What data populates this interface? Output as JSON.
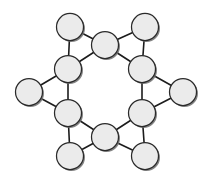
{
  "figure": {
    "background_color": "#ffffff",
    "width": 209,
    "height": 183
  },
  "chart_data": {
    "type": "scatter",
    "title": "",
    "subtitle": "",
    "xlabel": "",
    "ylabel": "",
    "xlim": [
      0,
      209
    ],
    "ylim": [
      0,
      183
    ],
    "grid": false,
    "legend": null,
    "annotations": [],
    "style": {
      "node_fill": "#ebebeb",
      "node_stroke": "#2a2a2a",
      "node_stroke_width": 1.25,
      "node_radius": 13.5,
      "node_shadow_color": "#6e6e6e",
      "node_shadow_offset": 1.5,
      "edge_color": "#1c1c1c",
      "edge_width": 1.6
    },
    "node_count": 14,
    "edge_count": 18,
    "nodes": [
      {
        "id": "inner-top",
        "label": "",
        "x": 105,
        "y": 45,
        "r": 13.5,
        "ring": "inner"
      },
      {
        "id": "inner-upper-right",
        "label": "",
        "x": 142,
        "y": 69,
        "r": 13.5,
        "ring": "inner"
      },
      {
        "id": "inner-lower-right",
        "label": "",
        "x": 142,
        "y": 113,
        "r": 13.5,
        "ring": "inner"
      },
      {
        "id": "inner-bottom",
        "label": "",
        "x": 105,
        "y": 137,
        "r": 13.5,
        "ring": "inner"
      },
      {
        "id": "inner-lower-left",
        "label": "",
        "x": 68,
        "y": 113,
        "r": 13.5,
        "ring": "inner"
      },
      {
        "id": "inner-upper-left",
        "label": "",
        "x": 68,
        "y": 69,
        "r": 13.5,
        "ring": "inner"
      },
      {
        "id": "outer-top-left",
        "label": "",
        "x": 70,
        "y": 27,
        "r": 13.5,
        "ring": "outer"
      },
      {
        "id": "outer-top-right",
        "label": "",
        "x": 145,
        "y": 27,
        "r": 13.5,
        "ring": "outer"
      },
      {
        "id": "outer-right",
        "label": "",
        "x": 183,
        "y": 92,
        "r": 13.5,
        "ring": "outer"
      },
      {
        "id": "outer-bottom-right",
        "label": "",
        "x": 145,
        "y": 156,
        "r": 13.5,
        "ring": "outer"
      },
      {
        "id": "outer-bottom-left",
        "label": "",
        "x": 70,
        "y": 156,
        "r": 13.5,
        "ring": "outer"
      },
      {
        "id": "outer-left",
        "label": "",
        "x": 29,
        "y": 92,
        "r": 13.5,
        "ring": "outer"
      }
    ],
    "edges": [
      {
        "source": "inner-top",
        "target": "inner-upper-right"
      },
      {
        "source": "inner-upper-right",
        "target": "inner-lower-right"
      },
      {
        "source": "inner-lower-right",
        "target": "inner-bottom"
      },
      {
        "source": "inner-bottom",
        "target": "inner-lower-left"
      },
      {
        "source": "inner-lower-left",
        "target": "inner-upper-left"
      },
      {
        "source": "inner-upper-left",
        "target": "inner-top"
      },
      {
        "source": "outer-top-left",
        "target": "inner-top"
      },
      {
        "source": "outer-top-left",
        "target": "inner-upper-left"
      },
      {
        "source": "outer-top-right",
        "target": "inner-top"
      },
      {
        "source": "outer-top-right",
        "target": "inner-upper-right"
      },
      {
        "source": "outer-right",
        "target": "inner-upper-right"
      },
      {
        "source": "outer-right",
        "target": "inner-lower-right"
      },
      {
        "source": "outer-bottom-right",
        "target": "inner-lower-right"
      },
      {
        "source": "outer-bottom-right",
        "target": "inner-bottom"
      },
      {
        "source": "outer-bottom-left",
        "target": "inner-bottom"
      },
      {
        "source": "outer-bottom-left",
        "target": "inner-lower-left"
      },
      {
        "source": "outer-left",
        "target": "inner-lower-left"
      },
      {
        "source": "outer-left",
        "target": "inner-upper-left"
      }
    ]
  }
}
